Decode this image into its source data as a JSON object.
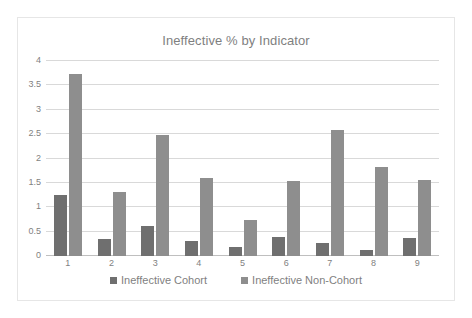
{
  "chart_data": {
    "type": "bar",
    "title": "Ineffective % by Indicator",
    "xlabel": "",
    "ylabel": "",
    "categories": [
      "1",
      "2",
      "3",
      "4",
      "5",
      "6",
      "7",
      "8",
      "9"
    ],
    "series": [
      {
        "name": "Ineffective Cohort",
        "color": "#6f6f6f",
        "values": [
          1.25,
          0.35,
          0.62,
          0.3,
          0.18,
          0.39,
          0.26,
          0.13,
          0.36
        ]
      },
      {
        "name": "Ineffective Non-Cohort",
        "color": "#8e8e8e",
        "values": [
          3.73,
          1.32,
          2.49,
          1.61,
          0.73,
          1.53,
          2.59,
          1.82,
          1.56
        ]
      }
    ],
    "ylim": [
      0,
      4
    ],
    "yticks": [
      "0",
      "0.5",
      "1",
      "1.5",
      "2",
      "2.5",
      "3",
      "3.5",
      "4"
    ],
    "ytick_values": [
      0,
      0.5,
      1,
      1.5,
      2,
      2.5,
      3,
      3.5,
      4
    ],
    "grid": true,
    "legend_position": "bottom",
    "title_color": "#7f7f7f",
    "gridline_color": "#d9d9d9",
    "axis_text_color": "#7f7f7f",
    "border_color": "#e6e6e6"
  }
}
